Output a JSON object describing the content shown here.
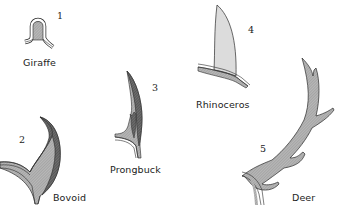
{
  "diagram": {
    "title": "",
    "colors": {
      "background": "#ffffff",
      "outline": "#2a2a2a",
      "keratin_dark": "#6a6a6a",
      "bone_light": "#b5b5b5",
      "horn_light": "#dcdcdc"
    },
    "items": [
      {
        "number": "1",
        "label": "Giraffe"
      },
      {
        "number": "2",
        "label": "Bovoid"
      },
      {
        "number": "3",
        "label": "Prongbuck"
      },
      {
        "number": "4",
        "label": "Rhinoceros"
      },
      {
        "number": "5",
        "label": "Deer"
      }
    ]
  }
}
